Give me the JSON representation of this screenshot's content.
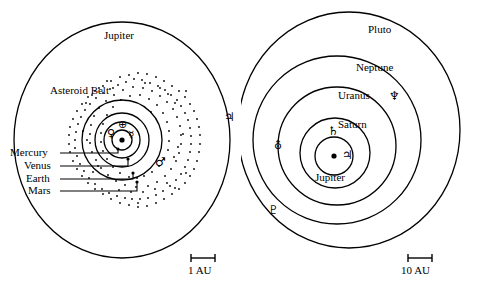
{
  "figure": {
    "type": "diagram",
    "panels": [
      {
        "id": "inner",
        "name": "inner-solar-system",
        "scale_bar": {
          "label": "1 AU",
          "length_au": 1
        },
        "labels": [
          {
            "key": "jupiter",
            "text": "Jupiter"
          },
          {
            "key": "asteroid_belt",
            "text": "Asteroid Belt"
          },
          {
            "key": "mercury",
            "text": "Mercury"
          },
          {
            "key": "venus",
            "text": "Venus"
          },
          {
            "key": "earth",
            "text": "Earth"
          },
          {
            "key": "mars",
            "text": "Mars"
          }
        ],
        "symbols": [
          {
            "key": "earth",
            "glyph": "⊕",
            "planet": "Earth"
          },
          {
            "key": "venus",
            "glyph": "♀",
            "planet": "Venus"
          },
          {
            "key": "mercury",
            "glyph": "☿",
            "planet": "Mercury"
          },
          {
            "key": "mars",
            "glyph": "♂",
            "planet": "Mars"
          },
          {
            "key": "jupiter",
            "glyph": "♃",
            "planet": "Jupiter"
          }
        ],
        "orbits": [
          {
            "planet": "Mercury",
            "radius_au": 0.39
          },
          {
            "planet": "Venus",
            "radius_au": 0.72
          },
          {
            "planet": "Earth",
            "radius_au": 1.0
          },
          {
            "planet": "Mars",
            "radius_au": 1.52
          },
          {
            "planet": "Jupiter",
            "radius_au": 5.2
          }
        ],
        "asteroid_belt": {
          "inner_au": 2.1,
          "outer_au": 3.3
        }
      },
      {
        "id": "outer",
        "name": "outer-solar-system",
        "scale_bar": {
          "label": "10 AU",
          "length_au": 10
        },
        "labels": [
          {
            "key": "pluto",
            "text": "Pluto"
          },
          {
            "key": "neptune",
            "text": "Neptune"
          },
          {
            "key": "uranus",
            "text": "Uranus"
          },
          {
            "key": "saturn",
            "text": "Saturn"
          },
          {
            "key": "jupiter",
            "text": "Jupiter"
          }
        ],
        "symbols": [
          {
            "key": "jupiter",
            "glyph": "♃",
            "planet": "Jupiter"
          },
          {
            "key": "saturn",
            "glyph": "♄",
            "planet": "Saturn"
          },
          {
            "key": "uranus",
            "glyph": "⛢",
            "planet": "Uranus"
          },
          {
            "key": "neptune",
            "glyph": "♆",
            "planet": "Neptune"
          },
          {
            "key": "pluto",
            "glyph": "♇",
            "planet": "Pluto"
          }
        ],
        "orbits": [
          {
            "planet": "Jupiter",
            "radius_au": 5.2
          },
          {
            "planet": "Saturn",
            "radius_au": 9.5
          },
          {
            "planet": "Uranus",
            "radius_au": 19.2
          },
          {
            "planet": "Neptune",
            "radius_au": 30.1
          },
          {
            "planet": "Pluto",
            "radius_au": 39.5
          }
        ]
      }
    ],
    "colors": {
      "stroke": "#000000",
      "background": "#ffffff"
    }
  }
}
